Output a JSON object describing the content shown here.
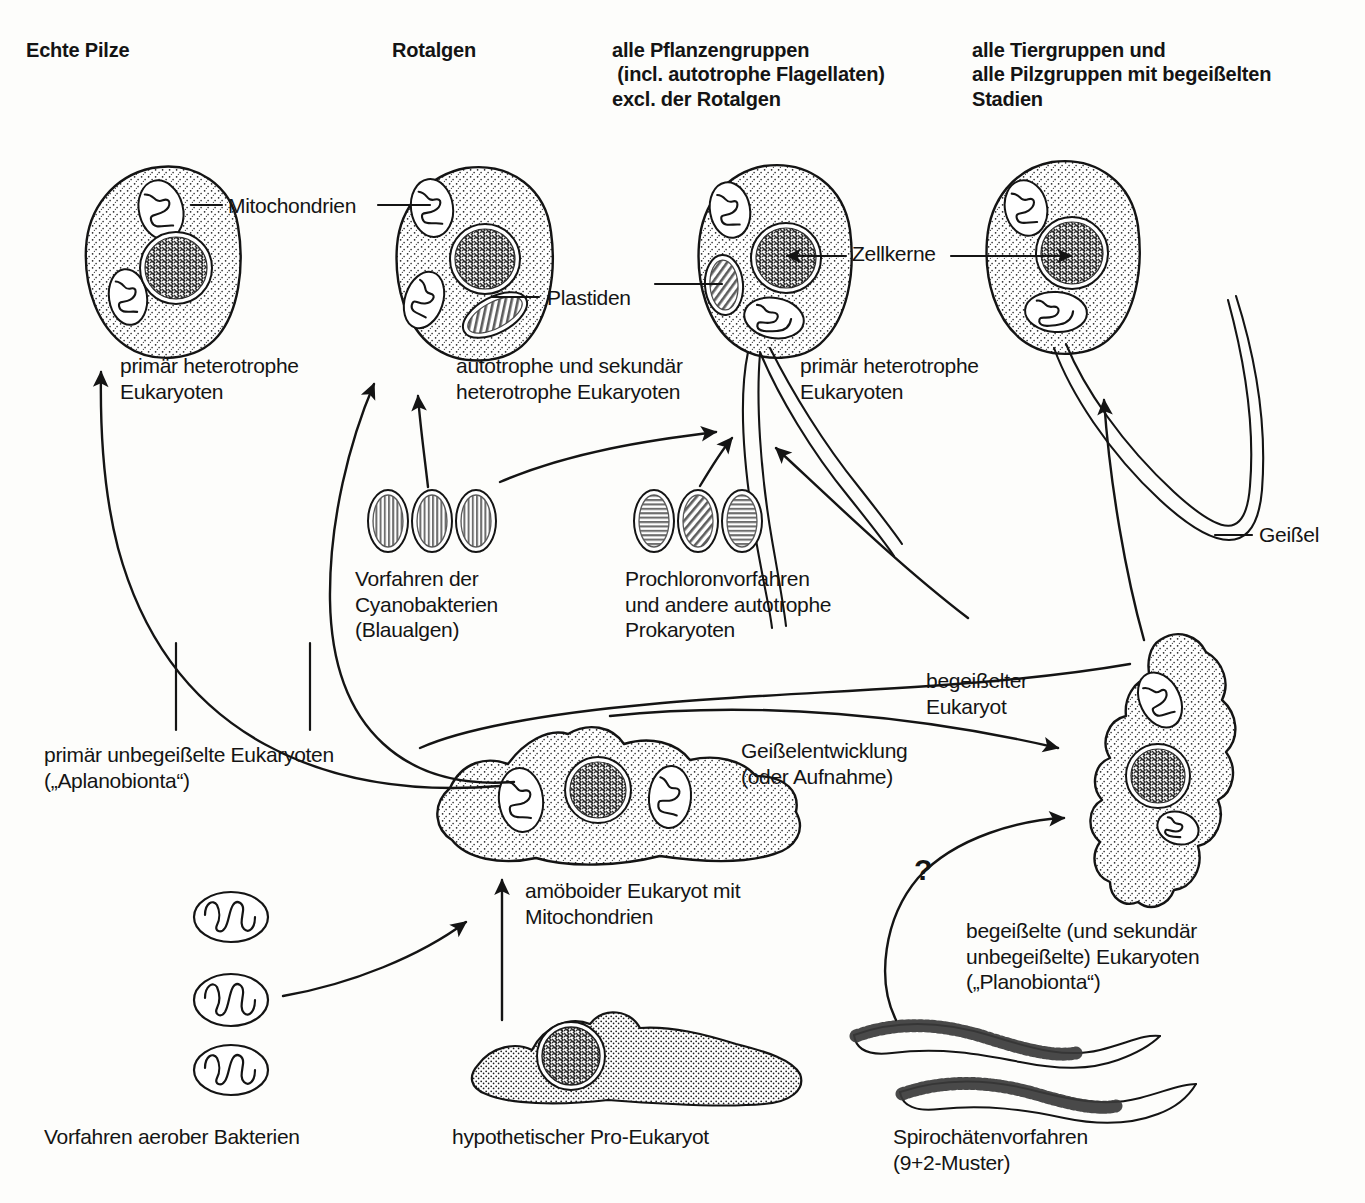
{
  "figure": {
    "type": "biological-schematic-diagram",
    "language": "de"
  },
  "column_headers": [
    {
      "id": "echte-pilze",
      "text": "Echte Pilze"
    },
    {
      "id": "rotalgen",
      "text": "Rotalgen"
    },
    {
      "id": "pflanzengruppen",
      "text": "alle Pflanzengruppen\n (incl. autotrophe Flagellaten)\nexcl. der Rotalgen"
    },
    {
      "id": "tiergruppen",
      "text": "alle Tiergruppen und\nalle Pilzgruppen mit begeißelten\nStadien"
    }
  ],
  "organelle_labels": [
    {
      "id": "mitochondrien",
      "text": "Mitochondrien"
    },
    {
      "id": "plastiden",
      "text": "Plastiden"
    },
    {
      "id": "zellkerne",
      "text": "Zellkerne"
    },
    {
      "id": "geissel",
      "text": "Geißel"
    }
  ],
  "cell_captions": [
    {
      "id": "cell1-caption",
      "text": "primär heterotrophe\nEukaryoten"
    },
    {
      "id": "cell2-caption",
      "text": "autotrophe und sekundär\nheterotrophe Eukaryoten"
    },
    {
      "id": "cell3-caption",
      "text": "primär heterotrophe\nEukaryoten"
    }
  ],
  "endosymbiont_captions": [
    {
      "id": "cyanobakterien",
      "text": "Vorfahren der\nCyanobakterien\n(Blaualgen)"
    },
    {
      "id": "prochloron",
      "text": "Prochloronvorfahren\nund andere autotrophe\nProkaryoten"
    }
  ],
  "group_captions": [
    {
      "id": "aplanobionta",
      "text": "primär unbegeißelte Eukaryoten\n(„Aplanobionta“)"
    },
    {
      "id": "planobionta",
      "text": "begeißelte (und sekundär\nunbegeißelte) Eukaryoten\n(„Planobionta“)"
    }
  ],
  "process_labels": [
    {
      "id": "geisselentwicklung",
      "text": "Geißelentwicklung\n(oder Aufnahme)"
    },
    {
      "id": "begeisselter-eukaryot",
      "text": "begeißelter\nEukaryot"
    },
    {
      "id": "amoeboider-eukaryot",
      "text": "amöboider Eukaryot mit\nMitochondrien"
    },
    {
      "id": "uncertainty",
      "text": "?"
    }
  ],
  "bottom_captions": [
    {
      "id": "aerobe-bakterien",
      "text": "Vorfahren aerober Bakterien"
    },
    {
      "id": "pro-eukaryot",
      "text": "hypothetischer Pro-Eukaryot"
    },
    {
      "id": "spirochaeten",
      "text": "Spirochätenvorfahren\n(9+2-Muster)"
    }
  ],
  "colors": {
    "ink": "#141414",
    "stipple": "#2a2a2a",
    "nucleus": "#4a4a4a",
    "background": "#fdfdfb"
  }
}
